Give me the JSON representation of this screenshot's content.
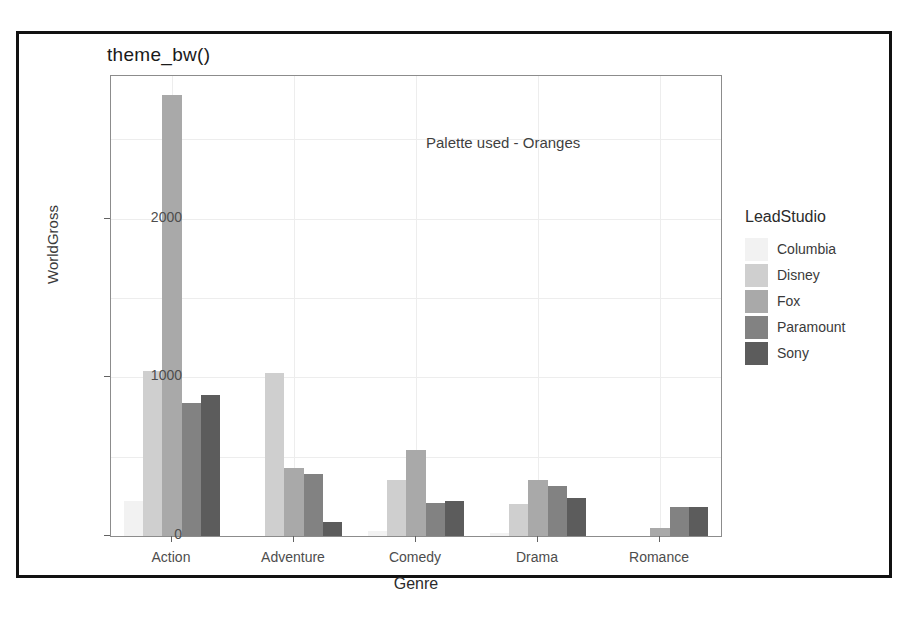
{
  "figure": {
    "title": "theme_bw()",
    "annotation": "Palette used - Oranges"
  },
  "legend": {
    "title": "LeadStudio"
  },
  "chart_data": {
    "type": "bar",
    "title": "theme_bw()",
    "xlabel": "Genre",
    "ylabel": "WorldGross",
    "categories": [
      "Action",
      "Adventure",
      "Comedy",
      "Drama",
      "Romance"
    ],
    "yticks": [
      0,
      1000,
      2000
    ],
    "ylim": [
      0,
      2900
    ],
    "grid": true,
    "legend_position": "right",
    "legend_title": "LeadStudio",
    "annotations": [
      "Palette used - Oranges"
    ],
    "palette": [
      "#f2f2f2",
      "#cfcfcf",
      "#a9a9a9",
      "#828282",
      "#5c5c5c"
    ],
    "series": [
      {
        "name": "Columbia",
        "color": "#f2f2f2",
        "values": [
          220,
          0,
          30,
          20,
          0
        ]
      },
      {
        "name": "Disney",
        "color": "#cfcfcf",
        "values": [
          1040,
          1030,
          350,
          200,
          0
        ]
      },
      {
        "name": "Fox",
        "color": "#a9a9a9",
        "values": [
          2780,
          430,
          545,
          355,
          50
        ]
      },
      {
        "name": "Paramount",
        "color": "#828282",
        "values": [
          840,
          390,
          210,
          315,
          185
        ]
      },
      {
        "name": "Sony",
        "color": "#5c5c5c",
        "values": [
          890,
          90,
          220,
          240,
          185
        ]
      }
    ]
  }
}
